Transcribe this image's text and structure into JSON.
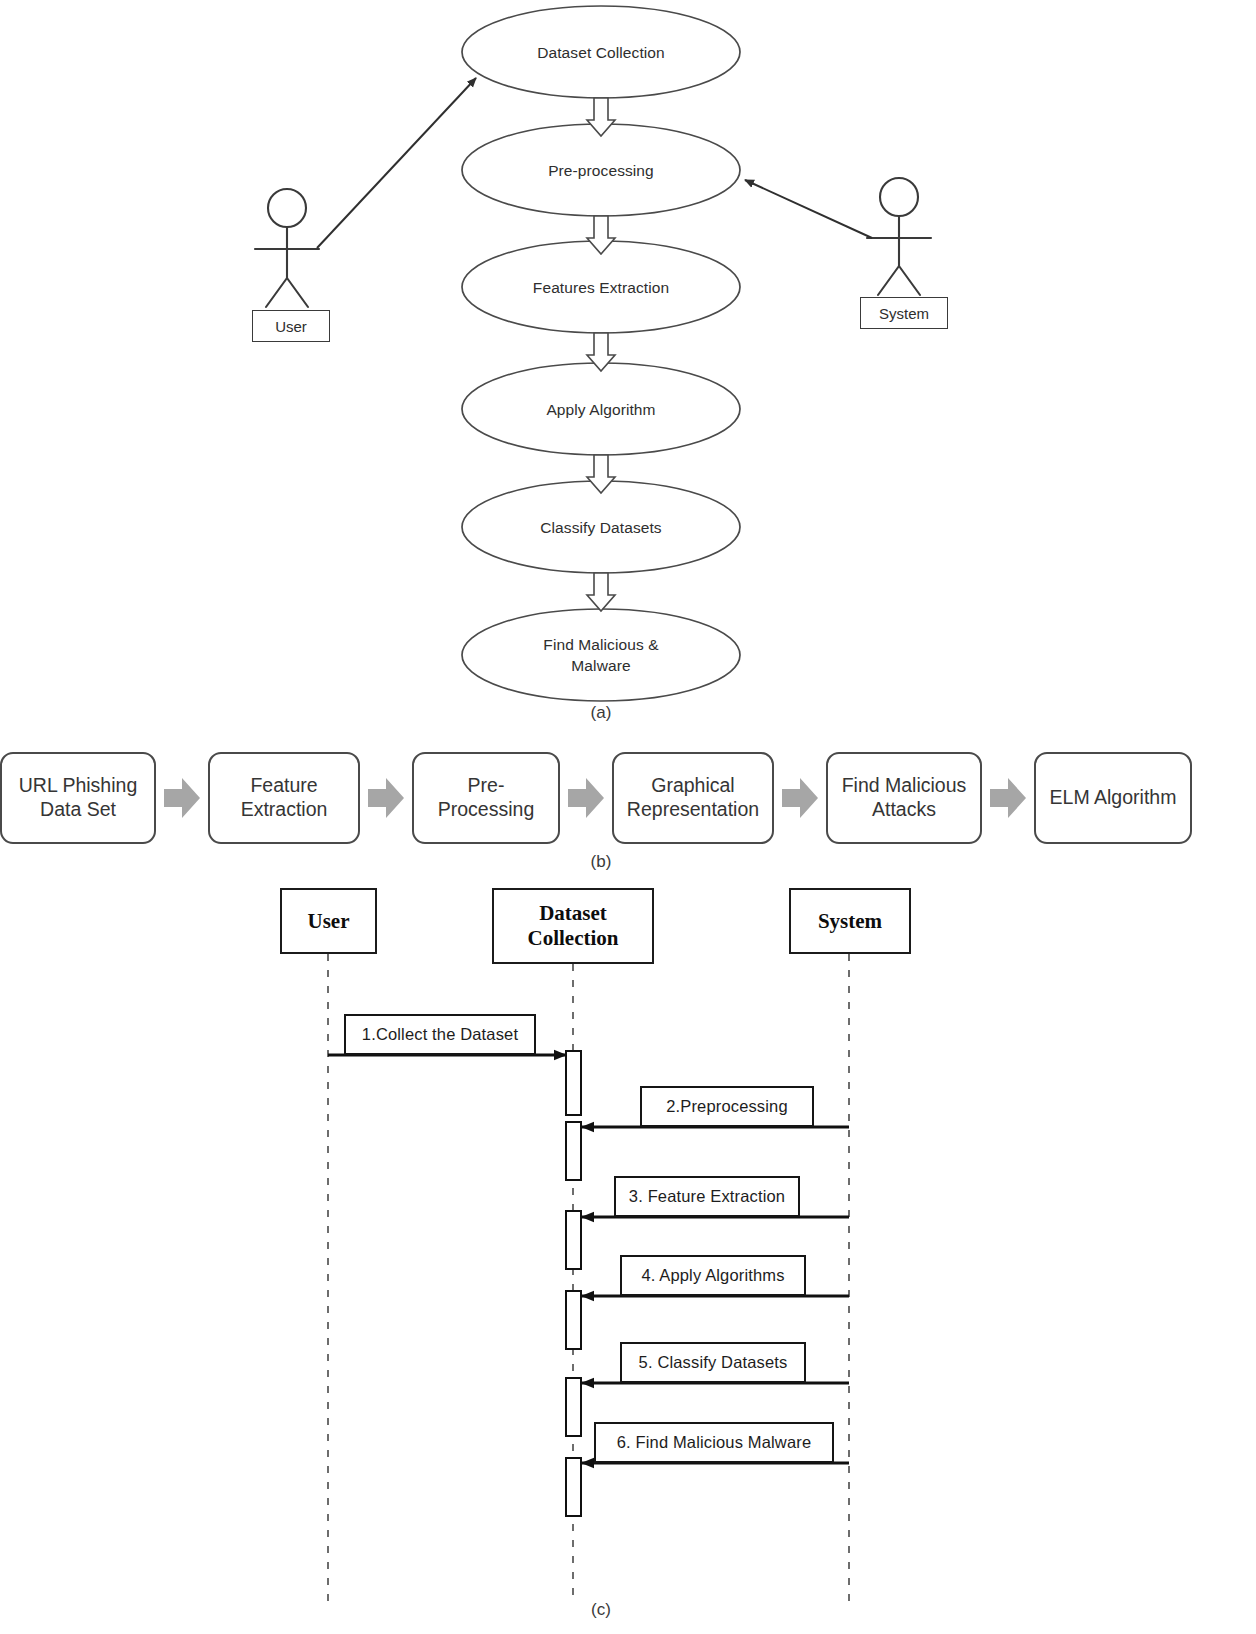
{
  "figure": {
    "captions": {
      "a": "(a)",
      "b": "(b)",
      "c": "(c)"
    }
  },
  "usecase": {
    "name": "use-case-diagram",
    "actors": [
      {
        "id": "user",
        "label": "User"
      },
      {
        "id": "system",
        "label": "System"
      }
    ],
    "usecases": [
      {
        "id": "dataset-collection",
        "label": "Dataset Collection"
      },
      {
        "id": "pre-processing",
        "label": "Pre-processing"
      },
      {
        "id": "features-extraction",
        "label": "Features Extraction"
      },
      {
        "id": "apply-algorithm",
        "label": "Apply Algorithm"
      },
      {
        "id": "classify-datasets",
        "label": "Classify Datasets"
      },
      {
        "id": "find-malicious-malware",
        "label": "Find Malicious &\nMalware"
      }
    ]
  },
  "pipeline": {
    "name": "process-pipeline",
    "steps": [
      {
        "id": "url-phishing-data-set",
        "label": "URL Phishing\nData Set",
        "width": 156
      },
      {
        "id": "feature-extraction",
        "label": "Feature\nExtraction",
        "width": 152
      },
      {
        "id": "pre-processing",
        "label": "Pre-Processing",
        "width": 148
      },
      {
        "id": "graphical-representation",
        "label": "Graphical\nRepresentation",
        "width": 162
      },
      {
        "id": "find-malicious-attacks",
        "label": "Find Malicious\nAttacks",
        "width": 156
      },
      {
        "id": "elm-algorithm",
        "label": "ELM Algorithm",
        "width": 158
      }
    ],
    "arrow_color": "#a6a6a6"
  },
  "sequence": {
    "name": "sequence-diagram",
    "lifelines": [
      {
        "id": "user",
        "label": "User"
      },
      {
        "id": "dataset-collection",
        "label": "Dataset\nCollection"
      },
      {
        "id": "system",
        "label": "System"
      }
    ],
    "messages": [
      {
        "id": "collect-the-dataset",
        "label": "1.Collect the Dataset",
        "from": "user",
        "to": "dataset-collection",
        "direction": "right"
      },
      {
        "id": "preprocessing",
        "label": "2.Preprocessing",
        "from": "system",
        "to": "dataset-collection",
        "direction": "left"
      },
      {
        "id": "feature-extraction",
        "label": "3. Feature Extraction",
        "from": "system",
        "to": "dataset-collection",
        "direction": "left"
      },
      {
        "id": "apply-algorithms",
        "label": "4. Apply Algorithms",
        "from": "system",
        "to": "dataset-collection",
        "direction": "left"
      },
      {
        "id": "classify-datasets",
        "label": "5. Classify Datasets",
        "from": "system",
        "to": "dataset-collection",
        "direction": "left"
      },
      {
        "id": "find-malicious-malware",
        "label": "6. Find Malicious Malware",
        "from": "system",
        "to": "dataset-collection",
        "direction": "left"
      }
    ]
  }
}
